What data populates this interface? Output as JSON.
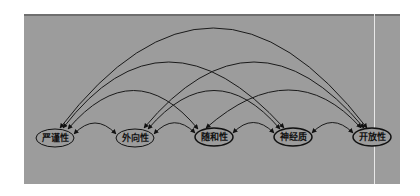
{
  "diagram": {
    "type": "arc-network",
    "colors": {
      "background": "#9c9c9c",
      "edge": "#1a1a1a",
      "node_fill": "#9c9c9c",
      "node_stroke": "#111111"
    },
    "nodes": [
      {
        "id": "n1",
        "label": "严谨性",
        "x": 55,
        "y": 138
      },
      {
        "id": "n2",
        "label": "外向性",
        "x": 135,
        "y": 138
      },
      {
        "id": "n3",
        "label": "随和性",
        "x": 214,
        "y": 137
      },
      {
        "id": "n4",
        "label": "神经质",
        "x": 293,
        "y": 137
      },
      {
        "id": "n5",
        "label": "开放性",
        "x": 372,
        "y": 137
      }
    ],
    "edges": [
      {
        "from": "n1",
        "to": "n2",
        "bidirectional": true
      },
      {
        "from": "n2",
        "to": "n3",
        "bidirectional": true
      },
      {
        "from": "n3",
        "to": "n4",
        "bidirectional": true
      },
      {
        "from": "n4",
        "to": "n5",
        "bidirectional": true
      },
      {
        "from": "n1",
        "to": "n3",
        "bidirectional": true
      },
      {
        "from": "n2",
        "to": "n4",
        "bidirectional": true
      },
      {
        "from": "n3",
        "to": "n5",
        "bidirectional": true
      },
      {
        "from": "n1",
        "to": "n4",
        "bidirectional": true
      },
      {
        "from": "n2",
        "to": "n5",
        "bidirectional": true
      },
      {
        "from": "n1",
        "to": "n5",
        "bidirectional": true
      }
    ]
  }
}
